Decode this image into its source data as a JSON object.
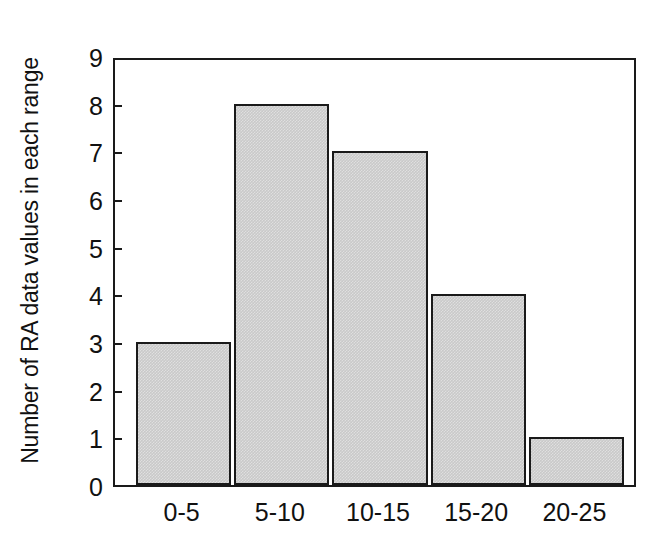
{
  "chart_data": {
    "type": "bar",
    "title": "",
    "subtitle": "",
    "xlabel": "",
    "ylabel": "Number of RA data values in each range",
    "categories": [
      "0-5",
      "5-10",
      "10-15",
      "15-20",
      "20-25"
    ],
    "values": [
      3,
      8,
      7,
      4,
      1
    ],
    "series": [
      {
        "name": "Number of RA data values in each range",
        "values": [
          3,
          8,
          7,
          4,
          1
        ]
      }
    ],
    "ylim": [
      0,
      9
    ],
    "yticks": [
      0,
      1,
      2,
      3,
      4,
      5,
      6,
      7,
      8,
      9
    ],
    "ytick_labels": [
      "0",
      "1",
      "2",
      "3",
      "4",
      "5",
      "6",
      "7",
      "8",
      "9"
    ],
    "grid": false,
    "legend": false,
    "legend_position": "none",
    "annotations": [],
    "colors": {
      "bar_fill": "#c9c9c9",
      "bar_edge": "#1a1a1a",
      "axis": "#1a1a1a",
      "text": "#111111",
      "background": "#ffffff"
    }
  }
}
